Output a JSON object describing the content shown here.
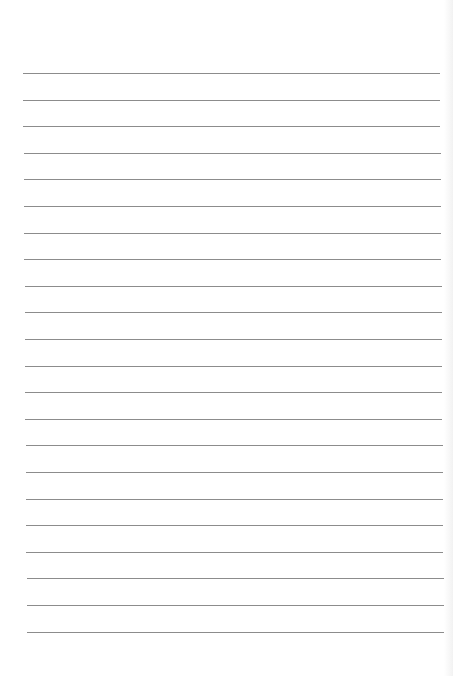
{
  "document": {
    "type": "lined-paper",
    "background_color": "#ffffff",
    "rule_color": "#8c8c8c",
    "rule_count": 22,
    "first_rule_y": 73,
    "rule_spacing": 26.6,
    "rule_left_start": 23,
    "rule_left_end": 27,
    "rule_right_start": 440,
    "rule_right_end": 444
  }
}
